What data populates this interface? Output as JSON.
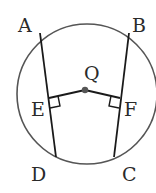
{
  "diagram": {
    "type": "geometry",
    "circle": {
      "center_label": "Q",
      "cx": 87,
      "cy": 96,
      "r": 70
    },
    "points": {
      "A": {
        "label": "A",
        "x": 40,
        "y": 33
      },
      "B": {
        "label": "B",
        "x": 129,
        "y": 33
      },
      "C": {
        "label": "C",
        "x": 114,
        "y": 156
      },
      "D": {
        "label": "D",
        "x": 55,
        "y": 156
      },
      "E": {
        "label": "E",
        "x": 49,
        "y": 99
      },
      "F": {
        "label": "F",
        "x": 120,
        "y": 98
      },
      "Q": {
        "label": "Q",
        "x": 85,
        "y": 90
      }
    },
    "segments": [
      {
        "name": "AD",
        "from": "A",
        "to": "D"
      },
      {
        "name": "BC",
        "from": "B",
        "to": "C"
      },
      {
        "name": "QE",
        "from": "Q",
        "to": "E"
      },
      {
        "name": "QF",
        "from": "Q",
        "to": "F"
      }
    ],
    "right_angles": [
      "E",
      "F"
    ],
    "colors": {
      "circle": "#555555",
      "lines": "#1a1a1a",
      "center_dot": "#555555",
      "text": "#2a2a2a"
    }
  }
}
